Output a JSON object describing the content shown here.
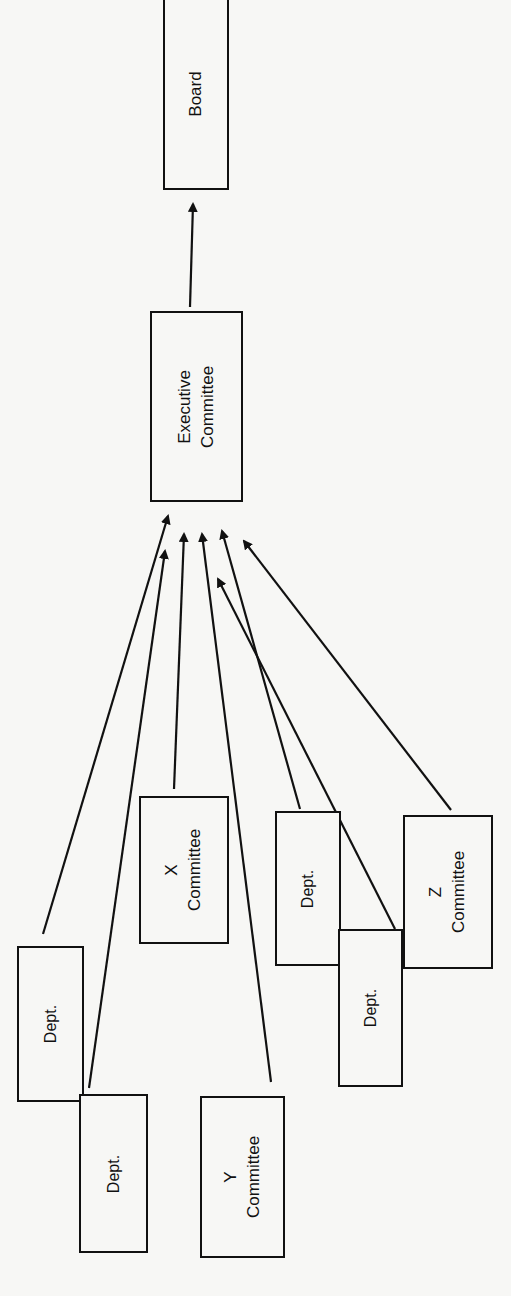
{
  "diagram": {
    "orientation": "rotated 90deg counter-clockwise (text reads bottom-to-top)",
    "nodes": {
      "board": {
        "label": "Board"
      },
      "executive": {
        "line1": "Executive",
        "line2": "Committee"
      },
      "dept_left_top": {
        "label": "Dept."
      },
      "dept_left_bottom": {
        "label": "Dept."
      },
      "x_committee": {
        "line1": "X",
        "line2": "Committee"
      },
      "y_committee": {
        "line1": "Y",
        "line2": "Committee"
      },
      "dept_mid_top": {
        "label": "Dept."
      },
      "dept_mid_bottom": {
        "label": "Dept."
      },
      "z_committee": {
        "line1": "Z",
        "line2": "Committee"
      }
    },
    "edges": [
      {
        "from": "Executive Committee",
        "to": "Board"
      },
      {
        "from": "Dept. (left top)",
        "to": "Executive Committee"
      },
      {
        "from": "Dept. (left bottom)",
        "to": "Executive Committee"
      },
      {
        "from": "X Committee",
        "to": "Executive Committee"
      },
      {
        "from": "Y Committee",
        "to": "Executive Committee"
      },
      {
        "from": "Dept. (middle top)",
        "to": "Executive Committee"
      },
      {
        "from": "Dept. (middle bottom)",
        "to": "Executive Committee"
      },
      {
        "from": "Z Committee",
        "to": "Executive Committee"
      }
    ],
    "colors": {
      "ink": "#111111",
      "paper": "#f7f7f5"
    }
  }
}
